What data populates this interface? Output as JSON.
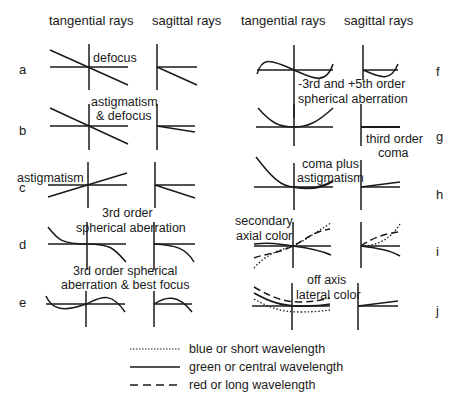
{
  "headers": {
    "left_tangential": "tangential rays",
    "left_sagittal": "sagittal rays",
    "right_tangential": "tangential rays",
    "right_sagittal": "sagittal rays"
  },
  "rows": {
    "a": {
      "label": "a",
      "annotation": "defocus"
    },
    "b": {
      "label": "b",
      "annotation_line1": "astigmatism",
      "annotation_line2": "& defocus"
    },
    "c": {
      "label": "c",
      "annotation": "astigmatism"
    },
    "d": {
      "label": "d",
      "annotation_line1": "3rd order",
      "annotation_line2": "spherical aberration"
    },
    "e": {
      "label": "e",
      "annotation_line1": "3rd order spherical",
      "annotation_line2": "aberration & best focus"
    },
    "f": {
      "label": "f",
      "annotation_line1": "-3rd and +5th order",
      "annotation_line2": "spherical aberration"
    },
    "g": {
      "label": "g",
      "annotation_line1": "third order",
      "annotation_line2": "coma"
    },
    "h": {
      "label": "h",
      "annotation_line1": "coma plus",
      "annotation_line2": "astigmatism"
    },
    "i": {
      "label": "i",
      "annotation_line1": "secondary",
      "annotation_line2": "axial color"
    },
    "j": {
      "label": "j",
      "annotation_line1": "off axis",
      "annotation_line2": "lateral color"
    }
  },
  "legend": {
    "items": [
      {
        "style": "dotted",
        "label": "blue or short wavelength"
      },
      {
        "style": "solid",
        "label": "green or central wavelength"
      },
      {
        "style": "dashed",
        "label": "red or long wavelength"
      }
    ]
  },
  "colors": {
    "line": "#1a1a1a",
    "background": "#ffffff"
  }
}
